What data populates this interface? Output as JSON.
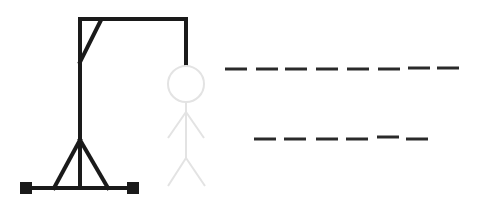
{
  "game": {
    "name": "Hangman",
    "gallows_color": "#1a1a1a",
    "figure_color": "#e3e3e3",
    "dash_color": "#2a2a2a"
  },
  "words": [
    {
      "letters": [
        "",
        "",
        "",
        "",
        "",
        "",
        "",
        ""
      ],
      "length": 8
    },
    {
      "letters": [
        "",
        "",
        "",
        "",
        "",
        ""
      ],
      "length": 6
    }
  ],
  "hangman_parts_visible": [
    "head",
    "body",
    "left-arm",
    "right-arm",
    "left-leg",
    "right-leg"
  ]
}
